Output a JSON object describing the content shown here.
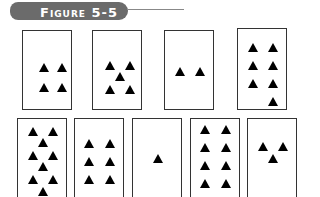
{
  "header": {
    "label": "Figure 5-5"
  },
  "colors": {
    "pill": "#6b6b6b",
    "card_border": "#333333",
    "triangle": "#000000"
  },
  "cards": [
    {
      "id": 1,
      "count": 4,
      "x": 22,
      "y": 30,
      "w": 50,
      "h": 80,
      "triangles": [
        [
          16,
          32
        ],
        [
          34,
          32
        ],
        [
          16,
          52
        ],
        [
          34,
          52
        ]
      ]
    },
    {
      "id": 2,
      "count": 5,
      "x": 92,
      "y": 30,
      "w": 50,
      "h": 80,
      "triangles": [
        [
          12,
          30
        ],
        [
          32,
          30
        ],
        [
          22,
          41
        ],
        [
          12,
          54
        ],
        [
          32,
          54
        ]
      ]
    },
    {
      "id": 3,
      "count": 2,
      "x": 164,
      "y": 30,
      "w": 50,
      "h": 80,
      "triangles": [
        [
          10,
          36
        ],
        [
          30,
          36
        ]
      ]
    },
    {
      "id": 4,
      "count": 7,
      "x": 237,
      "y": 28,
      "w": 50,
      "h": 82,
      "triangles": [
        [
          10,
          14
        ],
        [
          30,
          14
        ],
        [
          10,
          32
        ],
        [
          30,
          32
        ],
        [
          10,
          50
        ],
        [
          30,
          50
        ],
        [
          30,
          68
        ]
      ]
    },
    {
      "id": 5,
      "count": 9,
      "x": 17,
      "y": 118,
      "w": 50,
      "h": 82,
      "triangles": [
        [
          10,
          8
        ],
        [
          30,
          8
        ],
        [
          20,
          19
        ],
        [
          10,
          32
        ],
        [
          30,
          32
        ],
        [
          20,
          43
        ],
        [
          10,
          56
        ],
        [
          30,
          56
        ],
        [
          20,
          68
        ]
      ]
    },
    {
      "id": 6,
      "count": 6,
      "x": 74,
      "y": 118,
      "w": 50,
      "h": 82,
      "triangles": [
        [
          9,
          20
        ],
        [
          30,
          20
        ],
        [
          9,
          38
        ],
        [
          30,
          38
        ],
        [
          9,
          56
        ],
        [
          30,
          56
        ]
      ]
    },
    {
      "id": 7,
      "count": 1,
      "x": 132,
      "y": 118,
      "w": 50,
      "h": 82,
      "triangles": [
        [
          20,
          35
        ]
      ]
    },
    {
      "id": 8,
      "count": 8,
      "x": 190,
      "y": 118,
      "w": 50,
      "h": 82,
      "triangles": [
        [
          9,
          6
        ],
        [
          30,
          6
        ],
        [
          9,
          24
        ],
        [
          30,
          24
        ],
        [
          9,
          42
        ],
        [
          30,
          42
        ],
        [
          9,
          60
        ],
        [
          30,
          60
        ]
      ]
    },
    {
      "id": 9,
      "count": 3,
      "x": 247,
      "y": 118,
      "w": 50,
      "h": 82,
      "triangles": [
        [
          10,
          23
        ],
        [
          30,
          23
        ],
        [
          20,
          35
        ]
      ]
    }
  ]
}
